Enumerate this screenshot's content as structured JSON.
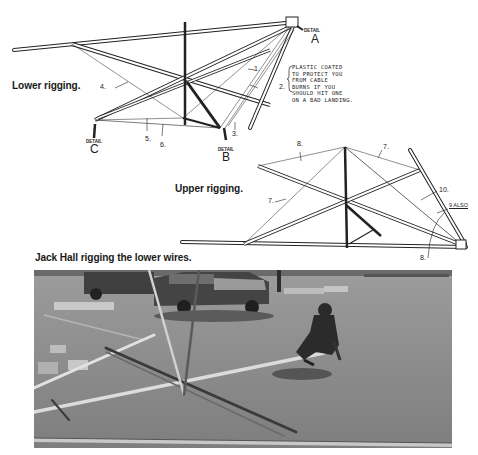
{
  "figures": {
    "lower_rigging": {
      "caption": "Lower rigging.",
      "detail_labels": [
        {
          "prefix": "DETAIL",
          "letter": "A"
        },
        {
          "prefix": "DETAIL",
          "letter": "B"
        },
        {
          "prefix": "DETAIL",
          "letter": "C"
        }
      ],
      "wire_numbers": [
        "1.",
        "2.",
        "3.",
        "4.",
        "5.",
        "6."
      ],
      "note": "PLASTIC COATED\nTO PROTECT YOU\nFROM CABLE\nBURNS IF YOU\nSHOULD HIT ONE\nON A BAD LANDING."
    },
    "upper_rigging": {
      "caption": "Upper rigging.",
      "wire_labels": [
        "8.",
        "7.",
        "7.",
        "10.",
        "9 ALSO",
        "8."
      ]
    },
    "photo": {
      "caption": "Jack Hall rigging the lower wires.",
      "description": "Man crouching on asphalt parking lot assembling hang glider frame tubes; pickup truck in background"
    }
  }
}
